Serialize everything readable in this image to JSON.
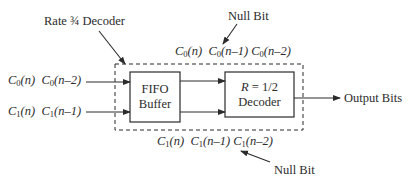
{
  "diagram": {
    "title_label": "Rate ¾ Decoder",
    "top_null_bit_label": "Null Bit",
    "bottom_null_bit_label": "Null Bit",
    "inputs": {
      "row0": [
        {
          "sym": "C",
          "sub": "0",
          "arg": "(n)"
        },
        {
          "sym": "C",
          "sub": "0",
          "arg": "(n–2)"
        }
      ],
      "row1": [
        {
          "sym": "C",
          "sub": "1",
          "arg": "(n)"
        },
        {
          "sym": "C",
          "sub": "1",
          "arg": "(n–1)"
        }
      ]
    },
    "top_sequence": [
      {
        "sym": "C",
        "sub": "0",
        "arg": "(n)"
      },
      {
        "sym": "C",
        "sub": "0",
        "arg": "(n–1)"
      },
      {
        "sym": "C",
        "sub": "0",
        "arg": "(n–2)"
      }
    ],
    "bottom_sequence": [
      {
        "sym": "C",
        "sub": "1",
        "arg": "(n)"
      },
      {
        "sym": "C",
        "sub": "1",
        "arg": "(n–1)"
      },
      {
        "sym": "C",
        "sub": "1",
        "arg": "(n–2)"
      }
    ],
    "fifo_block": {
      "line1": "FIFO",
      "line2": "Buffer"
    },
    "decoder_block": {
      "line1_var": "R",
      "line1_rest": " = 1/2",
      "line2": "Decoder"
    },
    "output_label": "Output Bits",
    "colors": {
      "stroke": "#2b2b2b",
      "background": "#ffffff"
    }
  }
}
